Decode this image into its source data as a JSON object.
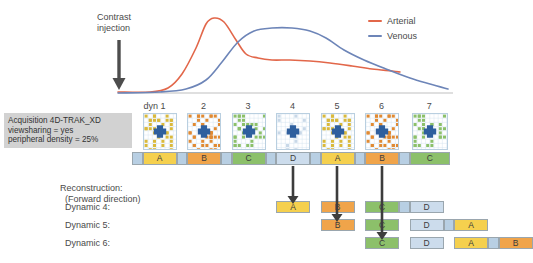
{
  "legend": {
    "items": [
      {
        "label": "Arterial",
        "color": "#e2674a"
      },
      {
        "label": "Venous",
        "color": "#6d85b8"
      }
    ]
  },
  "annotation": {
    "contrast_injection_line1": "Contrast",
    "contrast_injection_line2": "injection",
    "arrow_icon": "down-arrow-icon"
  },
  "acquisition": {
    "box_line1": "Acquisition 4D-TRAK_XD",
    "box_line2": "viewsharing = yes",
    "box_line3": "peripheral density = 25%",
    "dyn_labels": [
      "dyn 1",
      "2",
      "3",
      "4",
      "5",
      "6",
      "7"
    ],
    "segments": [
      {
        "label": "",
        "color": "#b8cfe3",
        "x": 0,
        "w": 10.5
      },
      {
        "label": "A",
        "color": "#f5d04e",
        "x": 10.5,
        "w": 34
      },
      {
        "label": "",
        "color": "#b8cfe3",
        "x": 44.5,
        "w": 10.5
      },
      {
        "label": "B",
        "color": "#f0a44a",
        "x": 55,
        "w": 34
      },
      {
        "label": "",
        "color": "#b8cfe3",
        "x": 89,
        "w": 10.5
      },
      {
        "label": "C",
        "color": "#8cc06a",
        "x": 99.5,
        "w": 34
      },
      {
        "label": "",
        "color": "#b8cfe3",
        "x": 133.5,
        "w": 10.5
      },
      {
        "label": "D",
        "color": "#ccdcec",
        "x": 144,
        "w": 34
      },
      {
        "label": "",
        "color": "#b8cfe3",
        "x": 178,
        "w": 10.5
      },
      {
        "label": "A",
        "color": "#f5d04e",
        "x": 188.5,
        "w": 34
      },
      {
        "label": "",
        "color": "#b8cfe3",
        "x": 222.5,
        "w": 10.5
      },
      {
        "label": "B",
        "color": "#f0a44a",
        "x": 233,
        "w": 34
      },
      {
        "label": "",
        "color": "#b8cfe3",
        "x": 267,
        "w": 10.5
      },
      {
        "label": "C",
        "color": "#8cc06a",
        "x": 277.5,
        "w": 40.5
      }
    ],
    "kspace_thumbnails": [
      {
        "dot_color": "#d9b93c",
        "density": "high"
      },
      {
        "dot_color": "#e08a33",
        "density": "high"
      },
      {
        "dot_color": "#8cc06a",
        "density": "medium"
      },
      {
        "dot_color": "#c8d8e8",
        "density": "low"
      },
      {
        "dot_color": "#d9b93c",
        "density": "high"
      },
      {
        "dot_color": "#e08a33",
        "density": "high"
      },
      {
        "dot_color": "#8cc06a",
        "density": "medium"
      }
    ],
    "kspace_center_color": "#2e5f9e"
  },
  "reconstruction": {
    "title_line1": "Reconstruction:",
    "title_line2": "(Forward direction)",
    "rows": [
      {
        "label": "Dynamic 4:",
        "start_x": 144,
        "segments": [
          {
            "label": "A",
            "color": "#f5d04e",
            "w": 34
          },
          {
            "label": "",
            "color": "#ffffff",
            "w": 10.5
          },
          {
            "label": "B",
            "color": "#f0a44a",
            "w": 34
          },
          {
            "label": "",
            "color": "#ffffff",
            "w": 10.5
          },
          {
            "label": "C",
            "color": "#8cc06a",
            "w": 34
          },
          {
            "label": "",
            "color": "#b8cfe3",
            "w": 10.5
          },
          {
            "label": "D",
            "color": "#ccdcec",
            "w": 34
          }
        ]
      },
      {
        "label": "Dynamic 5:",
        "start_x": 188.5,
        "segments": [
          {
            "label": "B",
            "color": "#f0a44a",
            "w": 34
          },
          {
            "label": "",
            "color": "#ffffff",
            "w": 10.5
          },
          {
            "label": "C",
            "color": "#8cc06a",
            "w": 34
          },
          {
            "label": "",
            "color": "#ffffff",
            "w": 10.5
          },
          {
            "label": "D",
            "color": "#ccdcec",
            "w": 34
          },
          {
            "label": "",
            "color": "#b8cfe3",
            "w": 10.5
          },
          {
            "label": "A",
            "color": "#f5d04e",
            "w": 34
          }
        ]
      },
      {
        "label": "Dynamic 6:",
        "start_x": 233,
        "segments": [
          {
            "label": "C",
            "color": "#8cc06a",
            "w": 34
          },
          {
            "label": "",
            "color": "#ffffff",
            "w": 10.5
          },
          {
            "label": "D",
            "color": "#ccdcec",
            "w": 34
          },
          {
            "label": "",
            "color": "#ffffff",
            "w": 10.5
          },
          {
            "label": "A",
            "color": "#f5d04e",
            "w": 34
          },
          {
            "label": "",
            "color": "#b8cfe3",
            "w": 10.5
          },
          {
            "label": "B",
            "color": "#f0a44a",
            "w": 34
          }
        ]
      }
    ],
    "flow_arrows": [
      {
        "from_x": 293,
        "to_y": 204,
        "name": "flow-arrow-d"
      },
      {
        "from_x": 337,
        "to_y": 222,
        "name": "flow-arrow-a"
      },
      {
        "from_x": 382,
        "to_y": 240,
        "name": "flow-arrow-b"
      }
    ]
  },
  "chart_data": {
    "type": "line",
    "title": "",
    "xlabel": "",
    "ylabel": "",
    "series": [
      {
        "name": "Arterial",
        "color": "#e2674a",
        "points": [
          [
            118,
            92
          ],
          [
            150,
            92
          ],
          [
            168,
            88
          ],
          [
            182,
            74
          ],
          [
            196,
            48
          ],
          [
            206,
            24
          ],
          [
            214,
            18
          ],
          [
            224,
            22
          ],
          [
            236,
            40
          ],
          [
            246,
            54
          ],
          [
            258,
            58
          ],
          [
            272,
            60
          ],
          [
            290,
            60
          ],
          [
            310,
            61
          ],
          [
            330,
            63
          ],
          [
            352,
            66
          ],
          [
            372,
            69
          ],
          [
            392,
            71
          ],
          [
            400,
            72
          ]
        ]
      },
      {
        "name": "Venous",
        "color": "#6d85b8",
        "points": [
          [
            118,
            93
          ],
          [
            160,
            92
          ],
          [
            186,
            89
          ],
          [
            206,
            80
          ],
          [
            222,
            62
          ],
          [
            238,
            42
          ],
          [
            254,
            31
          ],
          [
            272,
            28
          ],
          [
            292,
            28
          ],
          [
            310,
            31
          ],
          [
            326,
            38
          ],
          [
            344,
            50
          ],
          [
            364,
            60
          ],
          [
            386,
            69
          ],
          [
            410,
            78
          ],
          [
            430,
            84
          ],
          [
            448,
            89
          ]
        ]
      }
    ],
    "axis_baseline_y": 93,
    "grid": false,
    "legend_position": "top-right"
  }
}
